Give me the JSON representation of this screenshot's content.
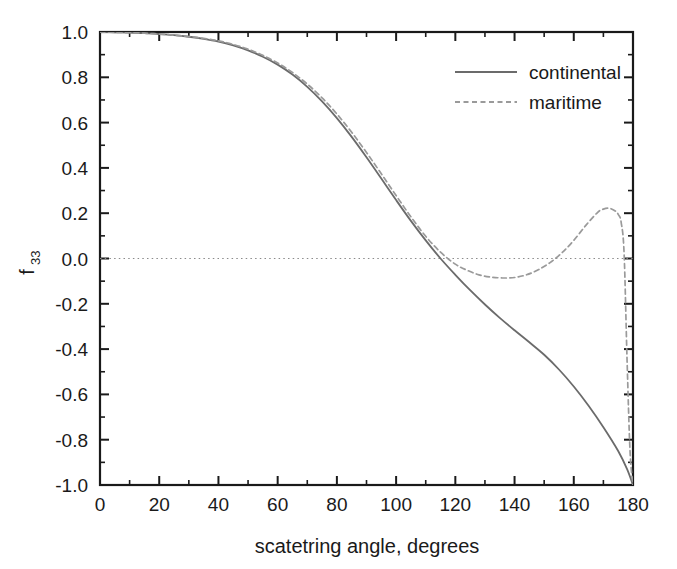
{
  "chart_data": {
    "type": "line",
    "title": "",
    "xlabel": "scatetring angle, degrees",
    "ylabel": "f33",
    "ylabel_base": "f",
    "ylabel_sub": "33",
    "xlim": [
      0,
      180
    ],
    "ylim": [
      -1.0,
      1.0
    ],
    "xticks": [
      0,
      20,
      40,
      60,
      80,
      100,
      120,
      140,
      160,
      180
    ],
    "xtick_labels": [
      "0",
      "20",
      "40",
      "60",
      "80",
      "100",
      "120",
      "140",
      "160",
      "180"
    ],
    "x_minor_step": 10,
    "yticks": [
      -1.0,
      -0.8,
      -0.6,
      -0.4,
      -0.2,
      0.0,
      0.2,
      0.4,
      0.6,
      0.8,
      1.0
    ],
    "ytick_labels": [
      "-1.0",
      "-0.8",
      "-0.6",
      "-0.4",
      "-0.2",
      "0.0",
      "0.2",
      "0.4",
      "0.6",
      "0.8",
      "1.0"
    ],
    "y_minor_step": 0.1,
    "grid": false,
    "zero_reference_line": {
      "value": 0.0,
      "style": "dotted",
      "color": "#8a8a8a"
    },
    "legend": {
      "position": "top-right",
      "entries": [
        {
          "name": "continental",
          "style": "solid",
          "color": "#6b6b6b"
        },
        {
          "name": "maritime",
          "style": "dashed",
          "color": "#9a9a9a"
        }
      ]
    },
    "axis_color": "#1a1a1a",
    "series": [
      {
        "name": "continental",
        "style": "solid",
        "color": "#6b6b6b",
        "x": [
          0,
          5,
          10,
          15,
          20,
          25,
          30,
          35,
          40,
          45,
          50,
          55,
          60,
          65,
          70,
          75,
          80,
          85,
          90,
          95,
          100,
          105,
          110,
          115,
          120,
          125,
          130,
          135,
          140,
          145,
          150,
          155,
          160,
          165,
          170,
          175,
          178,
          180
        ],
        "values": [
          1.0,
          0.999,
          0.997,
          0.995,
          0.991,
          0.986,
          0.979,
          0.97,
          0.958,
          0.941,
          0.919,
          0.891,
          0.856,
          0.812,
          0.758,
          0.694,
          0.62,
          0.537,
          0.447,
          0.353,
          0.258,
          0.166,
          0.08,
          0.0,
          -0.072,
          -0.14,
          -0.203,
          -0.262,
          -0.317,
          -0.37,
          -0.425,
          -0.49,
          -0.565,
          -0.65,
          -0.745,
          -0.85,
          -0.93,
          -1.0
        ]
      },
      {
        "name": "maritime",
        "style": "dashed",
        "color": "#9a9a9a",
        "x": [
          0,
          5,
          10,
          15,
          20,
          25,
          30,
          35,
          40,
          45,
          50,
          55,
          60,
          65,
          70,
          75,
          80,
          85,
          90,
          95,
          100,
          105,
          110,
          115,
          120,
          124,
          128,
          132,
          136,
          140,
          144,
          148,
          152,
          156,
          160,
          164,
          168,
          170,
          172,
          174,
          175,
          176,
          177,
          178,
          179,
          180
        ],
        "values": [
          1.0,
          0.999,
          0.997,
          0.995,
          0.991,
          0.986,
          0.98,
          0.972,
          0.961,
          0.945,
          0.924,
          0.897,
          0.863,
          0.821,
          0.77,
          0.709,
          0.638,
          0.557,
          0.468,
          0.374,
          0.278,
          0.184,
          0.098,
          0.028,
          -0.025,
          -0.052,
          -0.072,
          -0.082,
          -0.086,
          -0.084,
          -0.072,
          -0.05,
          -0.018,
          0.025,
          0.08,
          0.145,
          0.203,
          0.218,
          0.222,
          0.21,
          0.195,
          0.16,
          0.02,
          -0.45,
          -0.85,
          -1.0
        ]
      }
    ],
    "annotations": [
      {
        "text": "maritime peak",
        "x": 171,
        "y": 0.222
      },
      {
        "text": "maritime minimum",
        "x": 138,
        "y": -0.086
      },
      {
        "text": "continental zero crossing",
        "x": 115,
        "y": 0.0
      }
    ]
  }
}
